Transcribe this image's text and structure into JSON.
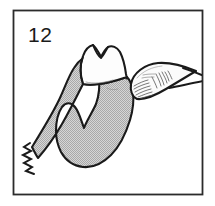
{
  "figure": {
    "number_label": "12",
    "caption": "",
    "frame": {
      "x": 13,
      "y": 10,
      "width": 190,
      "height": 185,
      "border_color": "#2b2b2b",
      "background_color": "#ffffff"
    }
  },
  "colors": {
    "outline": "#1a1a1a",
    "bone_fill": "#bfbfbf",
    "bone_stipple_light": "#d8d8d8",
    "bone_stipple_dark": "#a8a8a8",
    "tooth_fill": "#fdfdfd",
    "instrument_fill": "#fbfbfb",
    "instrument_hatch": "#4a4a4a",
    "page_background": "#ffffff"
  },
  "elements": {
    "alveolar_bone": {
      "name": "alveolar-bone",
      "description": "Stippled grey sectioned bone / gingival mass with arched inter-radicular notch",
      "fill": "#bfbfbf"
    },
    "tooth_crown": {
      "name": "tooth-crown",
      "description": "White bicuspid tooth crown with M-shaped occlusal outline",
      "fill": "#fdfdfd"
    },
    "break_line": {
      "name": "break-line",
      "description": "Zigzag cut-away break mark at lower left end of bone section"
    },
    "elevator_instrument": {
      "name": "elevator-instrument",
      "description": "Leaf shaped dental elevator blade with line hatching, shaft exits right frame edge",
      "fill": "#fbfbfb"
    }
  }
}
